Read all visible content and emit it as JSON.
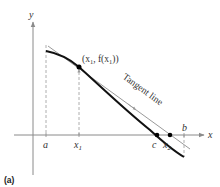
{
  "figure": {
    "caption": "(a)",
    "axes": {
      "x_label": "x",
      "y_label": "y"
    },
    "x_ticks": {
      "a": "a",
      "x1": "x",
      "x1_sub": "1",
      "c": "c",
      "x2": "x",
      "x2_sub": "2",
      "b": "b"
    },
    "point_label": {
      "open": "(x",
      "sub1": "1",
      "mid": ", f(x",
      "sub2": "1",
      "close": "))"
    },
    "tangent_label": "Tangent line",
    "colors": {
      "curve": "#111111",
      "tangent": "#9a9a9a",
      "axis": "#8a8a8a",
      "dashed": "#9a9a9a",
      "point": "#000000"
    }
  }
}
